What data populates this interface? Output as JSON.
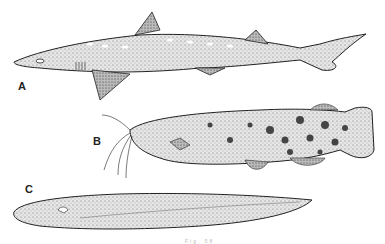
{
  "figure": {
    "labels": {
      "a": "A",
      "b": "B",
      "c": "C"
    },
    "caption": "Fig. 58",
    "subjects": [
      {
        "label": "A",
        "description": "spiny dogfish shark, side view"
      },
      {
        "label": "B",
        "description": "spotted catfish with barbels, side view"
      },
      {
        "label": "C",
        "description": "eel-like hagfish/lamprey, side view"
      }
    ],
    "colors": {
      "ink": "#222222",
      "fill": "#d9d9d9",
      "background": "#ffffff"
    }
  }
}
